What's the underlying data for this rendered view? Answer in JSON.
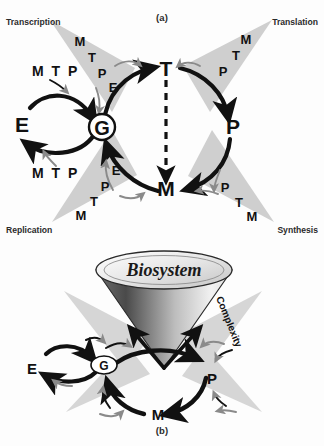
{
  "figure": {
    "panels": [
      {
        "id": "a",
        "caption": "(a)",
        "corner_labels": [
          {
            "name": "transcription",
            "text": "Transcription",
            "position": "top-left"
          },
          {
            "name": "translation",
            "text": "Translation",
            "position": "top-right"
          },
          {
            "name": "replication",
            "text": "Replication",
            "position": "bottom-left"
          },
          {
            "name": "synthesis",
            "text": "Synthesis",
            "position": "bottom-right"
          }
        ],
        "nodes": [
          {
            "name": "node-g",
            "label": "G",
            "shape": "circled"
          },
          {
            "name": "node-t",
            "label": "T",
            "shape": "plain"
          },
          {
            "name": "node-p",
            "label": "P",
            "shape": "plain"
          },
          {
            "name": "node-m",
            "label": "M",
            "shape": "plain"
          },
          {
            "name": "node-e",
            "label": "E",
            "shape": "plain"
          }
        ],
        "wedges": [
          {
            "name": "wedge-transcription",
            "position": "top-left",
            "letters": [
              "M",
              "T",
              "P",
              "E"
            ]
          },
          {
            "name": "wedge-translation",
            "position": "top-right",
            "letters": [
              "M",
              "T",
              "P"
            ]
          },
          {
            "name": "wedge-replication",
            "position": "bottom-left",
            "letters": [
              "E",
              "P",
              "T",
              "M"
            ]
          },
          {
            "name": "wedge-synthesis",
            "position": "bottom-right",
            "letters": [
              "P",
              "T",
              "M"
            ]
          }
        ],
        "side_labels": [
          {
            "name": "mtp-upper",
            "text": "M T P"
          },
          {
            "name": "mtp-lower",
            "text": "M T P"
          }
        ],
        "cycle_order": [
          "G",
          "T",
          "P",
          "M",
          "G"
        ],
        "dashed_link": {
          "from": "T",
          "to": "M"
        }
      },
      {
        "id": "b",
        "caption": "(b)",
        "cone": {
          "name": "biosystem-cone",
          "top_label": "Biosystem",
          "axis_label": "Complexity"
        },
        "nodes": [
          {
            "name": "node-g",
            "label": "G",
            "shape": "circled"
          },
          {
            "name": "node-e",
            "label": "E",
            "shape": "plain"
          },
          {
            "name": "node-p",
            "label": "P",
            "shape": "plain"
          },
          {
            "name": "node-m",
            "label": "M",
            "shape": "plain"
          }
        ],
        "wedges": [
          {
            "name": "wedge-top-left",
            "position": "top-left"
          },
          {
            "name": "wedge-top-right",
            "position": "top-right"
          },
          {
            "name": "wedge-bottom-left",
            "position": "bottom-left"
          },
          {
            "name": "wedge-bottom-right",
            "position": "bottom-right"
          }
        ],
        "cycle_order": [
          "G",
          "P",
          "M",
          "G"
        ]
      }
    ]
  },
  "colors": {
    "ink": "#111111",
    "wedge": "#cfcfcf",
    "thin_arrow": "#8a8a8a",
    "label_text": "#2b2b2b",
    "cone_dark": "#4a4a4a",
    "cone_light": "#f2f2f2"
  }
}
